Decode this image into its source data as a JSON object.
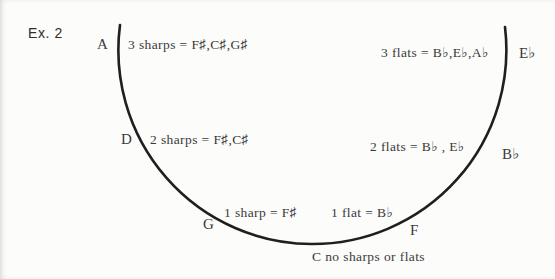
{
  "figure": {
    "example_label": "Ex. 2",
    "notes": {
      "A": "A",
      "D": "D",
      "G": "G",
      "F": "F",
      "Bb": "B♭",
      "Eb": "E♭"
    },
    "annotations": {
      "three_sharps": "3 sharps = F♯,C♯,G♯",
      "two_sharps": "2 sharps = F♯,C♯",
      "one_sharp": "1 sharp = F♯",
      "three_flats": "3 flats = B♭,E♭,A♭",
      "two_flats": "2 flats = B♭ , E♭",
      "one_flat": "1 flat = B♭",
      "c_caption": "C no sharps or flats"
    },
    "colors": {
      "ink": "#3a3a3a",
      "arc": "#1f1f1f",
      "background": "#fcfcfb"
    }
  }
}
